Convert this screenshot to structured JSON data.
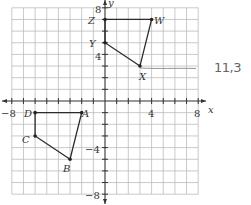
{
  "chart_data": {
    "type": "scatter",
    "title": "",
    "xlabel": "x",
    "ylabel": "y",
    "xlim": [
      -8,
      8
    ],
    "ylim": [
      -8,
      8
    ],
    "grid": true,
    "grid_step": 1,
    "x_tick_labels": [
      "-8",
      "4",
      "8"
    ],
    "y_tick_labels": [
      "8",
      "4",
      "-4",
      "-8"
    ],
    "series": [
      {
        "name": "Quadrilateral WXYZ",
        "closed": true,
        "points": [
          {
            "label": "Z",
            "x": 0,
            "y": 7
          },
          {
            "label": "W",
            "x": 4,
            "y": 7
          },
          {
            "label": "X",
            "x": 3,
            "y": 3
          },
          {
            "label": "Y",
            "x": 0,
            "y": 5
          }
        ]
      },
      {
        "name": "Quadrilateral ABCD",
        "closed": true,
        "points": [
          {
            "label": "D",
            "x": -6,
            "y": -1
          },
          {
            "label": "A",
            "x": -2,
            "y": -1
          },
          {
            "label": "B",
            "x": -3,
            "y": -5
          },
          {
            "label": "C",
            "x": -6,
            "y": -3
          }
        ]
      }
    ],
    "annotations": [
      {
        "type": "handwritten-line",
        "from": [
          3,
          3
        ],
        "to": [
          8,
          3
        ]
      },
      {
        "type": "handwritten-text",
        "text": "11,3"
      }
    ]
  },
  "labels": {
    "x_axis": "x",
    "y_axis": "y",
    "xt_neg8": "−8",
    "xt_4": "4",
    "xt_8": "8",
    "yt_8": "8",
    "yt_4": "4",
    "yt_neg4": "−4",
    "yt_neg8": "−8",
    "Z": "Z",
    "W": "W",
    "X": "X",
    "Y": "Y",
    "A": "A",
    "B": "B",
    "C": "C",
    "D": "D",
    "handwritten": "11,3"
  }
}
